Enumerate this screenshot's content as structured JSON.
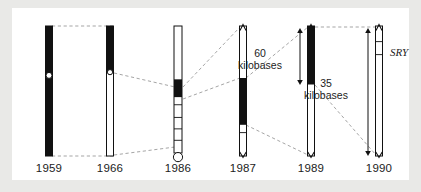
{
  "figure": {
    "background_color": "#ffffff",
    "page_background_color": "#e9e9e7",
    "ink_color": "#111111",
    "dashed_color": "#9b9b9b"
  },
  "columns": [
    {
      "id": "col-1959",
      "year_label": "1959",
      "center_x": 37,
      "chromosome": {
        "top": 18,
        "bottom": 148,
        "width": 7,
        "outline": true,
        "segments": [
          {
            "name": "whole-arm",
            "from": 0.0,
            "to": 1.0,
            "fill": "black"
          }
        ],
        "centromere_dot": {
          "at": 0.38,
          "radius": 3.0,
          "fill": "white"
        },
        "bottom_cap": "none",
        "ticks": []
      }
    },
    {
      "id": "col-1966",
      "year_label": "1966",
      "center_x": 98,
      "chromosome": {
        "top": 18,
        "bottom": 148,
        "width": 7,
        "outline": true,
        "segments": [
          {
            "name": "short-arm",
            "from": 0.0,
            "to": 0.35,
            "fill": "black"
          },
          {
            "name": "long-arm",
            "from": 0.35,
            "to": 1.0,
            "fill": "white"
          }
        ],
        "centromere_dot": {
          "at": 0.355,
          "radius": 2.6,
          "fill": "white"
        },
        "bottom_cap": "none",
        "ticks": []
      }
    },
    {
      "id": "col-1986",
      "year_label": "1986",
      "center_x": 166,
      "chromosome": {
        "top": 18,
        "bottom": 145,
        "width": 8,
        "outline": true,
        "segments": [
          {
            "name": "upper-euchromatin",
            "from": 0.0,
            "to": 0.42,
            "fill": "white"
          },
          {
            "name": "candidate-band",
            "from": 0.42,
            "to": 0.56,
            "fill": "black"
          },
          {
            "name": "lower-region",
            "from": 0.56,
            "to": 1.0,
            "fill": "white"
          }
        ],
        "centromere_dot": null,
        "bottom_cap": "circle",
        "bottom_cap_radius": 4.6,
        "ticks": [
          0.62,
          0.72,
          0.81,
          0.9
        ]
      }
    },
    {
      "id": "col-1987",
      "year_label": "1987",
      "center_x": 231,
      "chromosome": {
        "top": 18,
        "bottom": 148,
        "width": 7,
        "outline": true,
        "segments": [
          {
            "name": "upper-region",
            "from": 0.0,
            "to": 0.4,
            "fill": "white"
          },
          {
            "name": "candidate-interval",
            "from": 0.4,
            "to": 0.76,
            "fill": "black"
          },
          {
            "name": "lower-region",
            "from": 0.76,
            "to": 1.0,
            "fill": "white"
          }
        ],
        "centromere_dot": null,
        "bottom_cap": "arrowheads",
        "ticks": [
          0.82
        ]
      }
    },
    {
      "id": "col-1989",
      "year_label": "1989",
      "center_x": 299,
      "chromosome": {
        "top": 18,
        "bottom": 148,
        "width": 7,
        "outline": true,
        "segments": [
          {
            "name": "candidate-interval",
            "from": 0.0,
            "to": 0.45,
            "fill": "black"
          },
          {
            "name": "lower-region",
            "from": 0.45,
            "to": 1.0,
            "fill": "white"
          }
        ],
        "centromere_dot": null,
        "bottom_cap": "arrowheads",
        "ticks": []
      }
    },
    {
      "id": "col-1990",
      "year_label": "1990",
      "center_x": 367,
      "chromosome": {
        "top": 18,
        "bottom": 148,
        "width": 7,
        "outline": true,
        "segments": [
          {
            "name": "sry-interval",
            "from": 0.0,
            "to": 1.0,
            "fill": "white"
          }
        ],
        "centromere_dot": null,
        "bottom_cap": "arrowheads",
        "ticks": [
          0.12,
          0.22
        ]
      }
    }
  ],
  "measure_arrows": [
    {
      "id": "arrow-60kb",
      "label_line1": "60",
      "label_line2": "kilobases",
      "label_x": 248,
      "label_y": 40,
      "axis_x": 288,
      "top_y": 20,
      "bottom_y": 77
    },
    {
      "id": "arrow-35kb",
      "label_line1": "35",
      "label_line2": "kilobases",
      "label_x": 314,
      "label_y": 70,
      "axis_x": 356,
      "top_y": 20,
      "bottom_y": 148
    }
  ],
  "gene_annotation": {
    "id": "sry-label",
    "text": "SRY",
    "x": 378,
    "y": 38
  },
  "year_label_y": 154,
  "connectors": [
    {
      "name": "1959-to-1966-top",
      "points": "40,18 101,18"
    },
    {
      "name": "1959-to-1966-bottom",
      "points": "40,148 101,148"
    },
    {
      "name": "1966-centromere-to-1986-band",
      "points": "102,65 163,79"
    },
    {
      "name": "1966-bottom-to-1986-bottom",
      "points": "102,147 163,139"
    },
    {
      "name": "1986-band-top-to-1987-top",
      "points": "171,79 228,19"
    },
    {
      "name": "1986-band-bottom-to-1987-black-top",
      "points": "171,91 228,70"
    },
    {
      "name": "1987-black-top-to-1989-top",
      "points": "234,70 296,19"
    },
    {
      "name": "1987-black-bottom-to-1989-bottom",
      "points": "234,117 296,147"
    },
    {
      "name": "1989-top-to-1990-top",
      "points": "303,19 364,19"
    },
    {
      "name": "1989-black-bottom-to-1990-bottom",
      "points": "303,77 364,147"
    }
  ]
}
